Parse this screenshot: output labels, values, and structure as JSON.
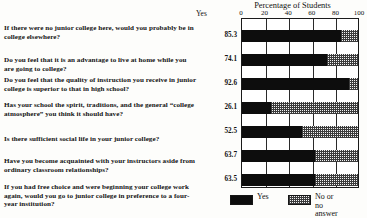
{
  "chart_data": {
    "type": "bar",
    "title": "Percentage of Students",
    "xlabel": "",
    "ylabel": "Yes",
    "xlim": [
      0,
      100
    ],
    "xticks": [
      0,
      20,
      40,
      60,
      80,
      100
    ],
    "xticklabels": [
      "0",
      "20",
      "40",
      "60",
      "80",
      "100"
    ],
    "grid": true,
    "orientation": "horizontal",
    "stacked": true,
    "legend_position": "bottom-center",
    "categories": [
      "If there were no junior college here, would you probably be in college elsewhere?",
      "Do you feel that it is an advantage to live at home while you are going to college?",
      "Do you feel that the quality of instruction you receive in junior college is superior to that in high school?",
      "Has your school the spirit, traditions, and the general “college atmosphere” you think it should have?",
      "Is there sufficient social life in your junior college?",
      "Have you become acquainted with your instructors aside from ordinary classroom relationships?",
      "If you had free choice and were beginning your college work again, would you go to junior college in preference to a four-year institution?"
    ],
    "series": [
      {
        "name": "Yes",
        "color": "#0d0d0d",
        "values": [
          85.3,
          74.1,
          92.6,
          26.1,
          52.5,
          63.7,
          63.5
        ]
      },
      {
        "name": "No or no answer",
        "color": "#f2f2f2",
        "values": [
          14.7,
          25.9,
          7.4,
          73.9,
          47.5,
          36.3,
          36.5
        ]
      }
    ],
    "value_labels": [
      "85.3",
      "74.1",
      "92.6",
      "26.1",
      "52.5",
      "63.7",
      "63.5"
    ]
  },
  "legend": {
    "items": [
      {
        "label": "Yes",
        "pattern": "solid"
      },
      {
        "label": "No or no\nanswer",
        "pattern": "checks"
      }
    ]
  },
  "questions": [
    {
      "text": "If there were no junior college here, would you probably be in college elsewhere?",
      "top": 5
    },
    {
      "text": "Do you feel that it is an advantage to live at home while you are going to college?",
      "top": 37
    },
    {
      "text": "Do you feel that the quality of instruction you receive in junior college is superior to that in high school?",
      "top": 57
    },
    {
      "text": "Has your school the spirit, traditions, and the general “college atmosphere” you think it should have?",
      "top": 82
    },
    {
      "text": "Is there sufficient social life in your junior college?",
      "top": 116
    },
    {
      "text": "Have you become acquainted with your instructors aside from ordinary classroom relationships?",
      "top": 138
    },
    {
      "text": "If you had free choice and were beginning your college work again, would you go to junior college in preference to a four-year institution?",
      "top": 164
    }
  ]
}
